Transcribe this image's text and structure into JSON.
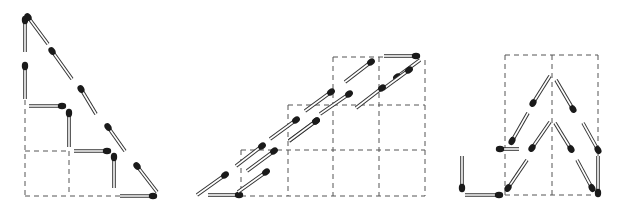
{
  "diagram": {
    "type": "matchstick-puzzle",
    "colors": {
      "background": "#ffffff",
      "grid": "#555555",
      "match_outline": "#333333",
      "match_body": "#ffffff",
      "match_head": "#1a1a1a"
    },
    "figures": [
      {
        "id": "figure-1",
        "name": "staircase-triangle",
        "grid_lines": [
          [
            25,
            100,
            25,
            196
          ],
          [
            25,
            196,
            155,
            196
          ],
          [
            69,
            151,
            69,
            196
          ],
          [
            25,
            151,
            69,
            151
          ]
        ],
        "matches": [
          [
            25,
            52,
            25,
            20
          ],
          [
            25,
            99,
            25,
            66
          ],
          [
            29,
            106,
            62,
            106
          ],
          [
            69,
            147,
            69,
            113
          ],
          [
            74,
            151,
            107,
            151
          ],
          [
            114,
            188,
            114,
            157
          ],
          [
            120,
            196,
            153,
            196
          ],
          [
            48,
            44,
            28,
            17
          ],
          [
            72,
            79,
            52,
            51
          ],
          [
            96,
            114,
            81,
            89
          ],
          [
            125,
            151,
            108,
            127
          ],
          [
            157,
            192,
            137,
            166
          ]
        ]
      },
      {
        "id": "figure-2",
        "name": "parallelogram-staircase",
        "grid_lines": [
          [
            333,
            57,
            383,
            57
          ],
          [
            333,
            57,
            333,
            196
          ],
          [
            425,
            60,
            425,
            196
          ],
          [
            288,
            105,
            425,
            105
          ],
          [
            288,
            105,
            288,
            196
          ],
          [
            241,
            150,
            425,
            150
          ],
          [
            241,
            150,
            241,
            196
          ],
          [
            379,
            57,
            379,
            196
          ],
          [
            241,
            196,
            425,
            196
          ]
        ],
        "matches": [
          [
            384,
            56,
            416,
            56
          ],
          [
            420,
            60,
            397,
            77
          ],
          [
            345,
            82,
            371,
            62
          ],
          [
            383,
            89,
            409,
            70
          ],
          [
            305,
            111,
            331,
            92
          ],
          [
            356,
            108,
            382,
            88
          ],
          [
            270,
            139,
            296,
            120
          ],
          [
            320,
            114,
            349,
            94
          ],
          [
            236,
            166,
            262,
            146
          ],
          [
            289,
            141,
            316,
            121
          ],
          [
            197,
            195,
            225,
            175
          ],
          [
            289,
            141,
            316,
            121
          ],
          [
            247,
            171,
            274,
            151
          ],
          [
            208,
            195,
            239,
            195
          ],
          [
            238,
            192,
            266,
            172
          ]
        ]
      },
      {
        "id": "figure-3",
        "name": "arrow-with-hook",
        "grid_lines": [
          [
            505,
            55,
            598,
            55
          ],
          [
            505,
            55,
            505,
            195
          ],
          [
            598,
            55,
            598,
            195
          ],
          [
            552,
            55,
            552,
            195
          ],
          [
            505,
            195,
            598,
            195
          ]
        ],
        "matches": [
          [
            519,
            149,
            500,
            149
          ],
          [
            462,
            156,
            462,
            188
          ],
          [
            465,
            195,
            499,
            195
          ],
          [
            550,
            76,
            533,
            103
          ],
          [
            556,
            80,
            573,
            109
          ],
          [
            528,
            113,
            512,
            141
          ],
          [
            550,
            122,
            532,
            148
          ],
          [
            555,
            123,
            571,
            149
          ],
          [
            583,
            123,
            598,
            150
          ],
          [
            527,
            160,
            508,
            188
          ],
          [
            577,
            160,
            592,
            188
          ],
          [
            598,
            156,
            598,
            193
          ]
        ]
      }
    ]
  }
}
